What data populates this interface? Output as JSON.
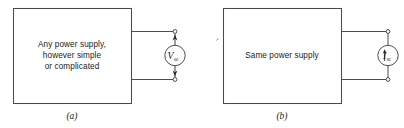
{
  "figure": {
    "type": "circuit-diagram",
    "width": 404,
    "height": 128,
    "background_color": "#ffffff",
    "line_color": "#3b3b3b",
    "text_color": "#1a1a1a"
  },
  "panels": [
    {
      "id": "a",
      "label": "(a)",
      "box_text_lines": [
        "Any power supply,",
        "however simple",
        "or complicated"
      ],
      "source": {
        "symbol": "voltage-source",
        "letter": "V",
        "subscript": "oc",
        "meaning": "open-circuit voltage",
        "arrows": "outside-circle-pointing-to-terminals"
      },
      "terminals": 2
    },
    {
      "id": "b",
      "label": "(b)",
      "box_text_lines": [
        "Same power supply"
      ],
      "source": {
        "symbol": "current-source",
        "letter": "I",
        "subscript": "sc",
        "meaning": "short-circuit current",
        "arrows": "inside-circle-pointing-up"
      },
      "terminals": 2
    }
  ]
}
